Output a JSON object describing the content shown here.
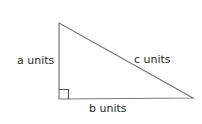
{
  "diagram": {
    "type": "right-triangle",
    "labels": {
      "a": "a units",
      "b": "b units",
      "c": "c units"
    },
    "colors": {
      "stroke": "#7a7a7a",
      "text": "#2a2a2a",
      "background": "#ffffff"
    },
    "right_angle_marker": true
  }
}
